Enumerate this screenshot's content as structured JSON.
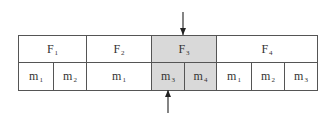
{
  "diagram": {
    "frames": [
      {
        "name": "F",
        "index": "1",
        "shaded": false,
        "x": 18,
        "w": 68,
        "members": [
          {
            "name": "m",
            "index": "1",
            "x": 18,
            "w": 35
          },
          {
            "name": "m",
            "index": "2",
            "x": 53,
            "w": 33
          }
        ]
      },
      {
        "name": "F",
        "index": "2",
        "shaded": false,
        "x": 86,
        "w": 65,
        "members": [
          {
            "name": "m",
            "index": "1",
            "x": 86,
            "w": 65
          }
        ]
      },
      {
        "name": "F",
        "index": "3",
        "shaded": true,
        "x": 151,
        "w": 65,
        "members": [
          {
            "name": "m",
            "index": "3",
            "x": 151,
            "w": 33
          },
          {
            "name": "m",
            "index": "4",
            "x": 184,
            "w": 32
          }
        ]
      },
      {
        "name": "F",
        "index": "4",
        "shaded": false,
        "x": 216,
        "w": 101,
        "members": [
          {
            "name": "m",
            "index": "1",
            "x": 216,
            "w": 35
          },
          {
            "name": "m",
            "index": "2",
            "x": 251,
            "w": 33
          },
          {
            "name": "m",
            "index": "3",
            "x": 284,
            "w": 33
          }
        ]
      }
    ],
    "arrows": [
      {
        "direction": "down",
        "x": 183,
        "y1": 12,
        "y2": 35
      },
      {
        "direction": "up",
        "x": 168,
        "y1": 113,
        "y2": 90
      }
    ],
    "colors": {
      "shade": "#d9d9d9",
      "line": "#555555"
    }
  }
}
